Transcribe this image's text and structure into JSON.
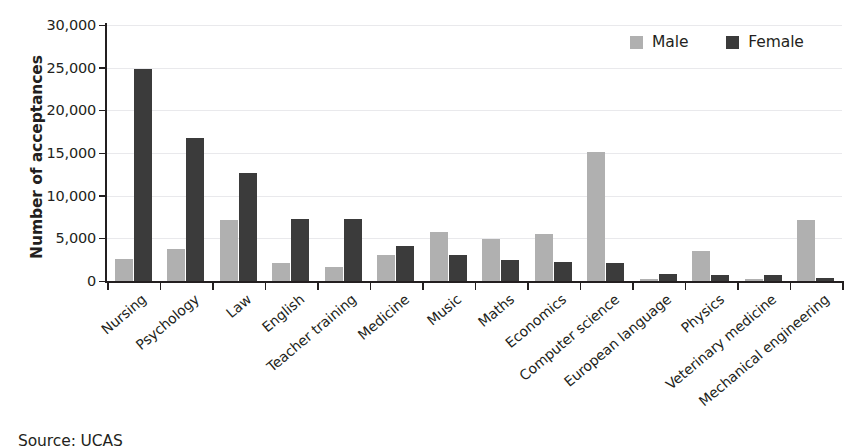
{
  "chart_data": {
    "type": "bar",
    "title": "",
    "xlabel": "",
    "ylabel": "Number of acceptances",
    "ylim": [
      0,
      30000
    ],
    "ytick_values": [
      0,
      5000,
      10000,
      15000,
      20000,
      25000,
      30000
    ],
    "ytick_labels": [
      "0",
      "5,000",
      "10,000",
      "15,000",
      "20,000",
      "25,000",
      "30,000"
    ],
    "grid": true,
    "legend_position": "top-right",
    "categories": [
      "Nursing",
      "Psychology",
      "Law",
      "English",
      "Teacher training",
      "Medicine",
      "Music",
      "Maths",
      "Economics",
      "Computer science",
      "European language",
      "Physics",
      "Veterinary medicine",
      "Mechanical engineering"
    ],
    "series": [
      {
        "name": "Male",
        "color": "#b0b0b0",
        "values": [
          2600,
          3800,
          7100,
          2100,
          1600,
          3100,
          5800,
          4900,
          5500,
          15100,
          200,
          3500,
          200,
          7100
        ]
      },
      {
        "name": "Female",
        "color": "#3b3b3b",
        "values": [
          24900,
          16800,
          12700,
          7300,
          7300,
          4100,
          3000,
          2500,
          2200,
          2100,
          800,
          700,
          700,
          400
        ]
      }
    ]
  },
  "legend": {
    "items": [
      {
        "label": "Male",
        "color": "#b0b0b0"
      },
      {
        "label": "Female",
        "color": "#3b3b3b"
      }
    ]
  },
  "source": {
    "text": "Source: UCAS"
  },
  "colors": {
    "male": "#b0b0b0",
    "female": "#3b3b3b",
    "axis": "#231f20",
    "gridline": "#e9e9ec",
    "background": "#ffffff"
  }
}
